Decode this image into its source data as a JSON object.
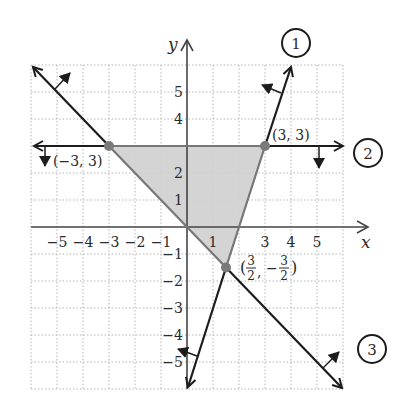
{
  "figure": {
    "axes": {
      "x_label": "x",
      "y_label": "y",
      "x_ticks": [
        {
          "value": -5,
          "label": "−5"
        },
        {
          "value": -4,
          "label": "−4"
        },
        {
          "value": -3,
          "label": "−3"
        },
        {
          "value": -2,
          "label": "−2"
        },
        {
          "value": -1,
          "label": "−1"
        },
        {
          "value": 1,
          "label": "1"
        },
        {
          "value": 3,
          "label": "3"
        },
        {
          "value": 4,
          "label": "4"
        },
        {
          "value": 5,
          "label": "5"
        }
      ],
      "y_ticks": [
        {
          "value": 5,
          "label": "5"
        },
        {
          "value": 4,
          "label": "4"
        },
        {
          "value": 2,
          "label": "2"
        },
        {
          "value": 1,
          "label": "1"
        },
        {
          "value": -1,
          "label": "−1"
        },
        {
          "value": -2,
          "label": "−2"
        },
        {
          "value": -3,
          "label": "−3"
        },
        {
          "value": -4,
          "label": "−4"
        },
        {
          "value": -5,
          "label": "−5"
        }
      ],
      "grid_range": [
        -6,
        6
      ]
    },
    "lines": [
      {
        "id": "1",
        "label": "1",
        "equation": "y = 3x − 6"
      },
      {
        "id": "2",
        "label": "2",
        "equation": "y = 3"
      },
      {
        "id": "3",
        "label": "3",
        "equation": "y = −x"
      }
    ],
    "vertices": [
      {
        "label": "(−3, 3)",
        "x": -3,
        "y": 3
      },
      {
        "label": "(3, 3)",
        "x": 3,
        "y": 3
      },
      {
        "label_prefix": "(",
        "num1": "3",
        "den1": "2",
        "sep": ",",
        "neg": "−",
        "num2": "3",
        "den2": "2",
        "label_suffix": ")",
        "x": 1.5,
        "y": -1.5
      }
    ],
    "colors": {
      "feasible_fill": "#cfcfcf",
      "boundary_line": "#1c1c1c",
      "axis": "#555555",
      "grid": "#b5b5b5",
      "vertex_dot": "#7a7a7a"
    }
  }
}
